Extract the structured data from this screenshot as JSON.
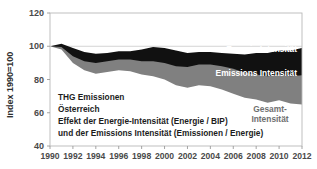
{
  "chart_data": {
    "type": "area",
    "title": "",
    "xlabel": "",
    "ylabel": "Index 1990=100",
    "ylim": [
      40,
      120
    ],
    "yticks": [
      40,
      60,
      80,
      100,
      120
    ],
    "ytick_labels": [
      "40",
      "60",
      "80",
      "100",
      "120"
    ],
    "xlim": [
      1990,
      2012
    ],
    "xticks": [
      1990,
      1992,
      1994,
      1996,
      1998,
      2000,
      2002,
      2004,
      2006,
      2008,
      2010,
      2012
    ],
    "xtick_labels": [
      "1990",
      "1992",
      "1994",
      "1996",
      "1998",
      "2000",
      "2002",
      "2004",
      "2006",
      "2008",
      "2010",
      "2012"
    ],
    "grid": true,
    "legend_position": "inline-labels",
    "x": [
      1990,
      1991,
      1992,
      1993,
      1994,
      1995,
      1996,
      1997,
      1998,
      1999,
      2000,
      2001,
      2002,
      2003,
      2004,
      2005,
      2006,
      2007,
      2008,
      2009,
      2010,
      2011,
      2012
    ],
    "series": [
      {
        "name": "Energie-Intensität",
        "label": "Energie-Intensität",
        "color": "#111111",
        "text_color": "#ffffff",
        "values": [
          100.0,
          101.5,
          99.0,
          96.5,
          95.5,
          96.0,
          97.0,
          97.0,
          98.0,
          99.5,
          99.0,
          97.5,
          96.0,
          96.5,
          96.5,
          96.0,
          95.5,
          95.0,
          96.0,
          96.0,
          97.5,
          97.5,
          99.0
        ]
      },
      {
        "name": "Emissions Intensität",
        "label": "Emissions Intensität",
        "color": "#808080",
        "text_color": "#ffffff",
        "values": [
          100.0,
          99.5,
          94.0,
          91.0,
          90.0,
          91.0,
          92.0,
          92.0,
          91.0,
          91.0,
          90.0,
          88.0,
          87.5,
          89.0,
          89.0,
          88.0,
          86.5,
          84.0,
          83.0,
          82.0,
          83.0,
          82.0,
          82.5
        ]
      },
      {
        "name": "Gesamt-Intensität",
        "label": "Gesamt-Intensität",
        "label_line1": "Gesamt-",
        "label_line2": "Intensität",
        "color": "#ffffff",
        "text_color": "#6f6f6f",
        "values": [
          100.0,
          98.0,
          90.0,
          85.5,
          83.5,
          84.5,
          85.5,
          85.0,
          83.0,
          82.0,
          80.0,
          76.5,
          75.0,
          76.5,
          76.0,
          74.0,
          71.5,
          69.0,
          68.0,
          66.0,
          67.5,
          65.5,
          65.0
        ]
      }
    ]
  },
  "caption": {
    "line1": "THG Emissionen",
    "line2": "Österreich",
    "line3": "Effekt der Energie-Intensität (Energie / BIP)",
    "line4": "und der Emissions Intensität (Emissionen / Energie)"
  }
}
